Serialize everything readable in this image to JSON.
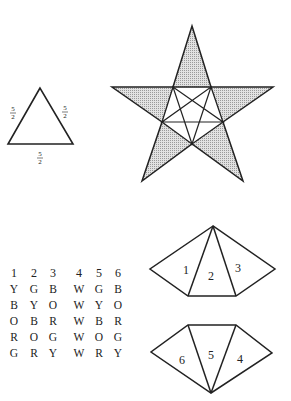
{
  "triangle": {
    "sides": [
      {
        "position": "left",
        "numerator": "5",
        "denominator": "2"
      },
      {
        "position": "right",
        "numerator": "5",
        "denominator": "2"
      },
      {
        "position": "bottom",
        "numerator": "5",
        "denominator": "2"
      }
    ]
  },
  "star": {
    "description": "Pentagram with shaded outer triangles and inscribed inner pentagram",
    "shade_color": "#cfcfcf",
    "line_color": "#222222"
  },
  "table": {
    "headers": [
      "1",
      "2",
      "3",
      "4",
      "5",
      "6"
    ],
    "rows": [
      [
        "Y",
        "G",
        "B",
        "W",
        "G",
        "B"
      ],
      [
        "B",
        "Y",
        "O",
        "W",
        "Y",
        "O"
      ],
      [
        "O",
        "B",
        "R",
        "W",
        "B",
        "R"
      ],
      [
        "R",
        "O",
        "G",
        "W",
        "O",
        "G"
      ],
      [
        "G",
        "R",
        "Y",
        "W",
        "R",
        "Y"
      ]
    ]
  },
  "top_net": {
    "labels": [
      "1",
      "2",
      "3"
    ]
  },
  "bottom_net": {
    "labels": [
      "6",
      "5",
      "4"
    ]
  }
}
